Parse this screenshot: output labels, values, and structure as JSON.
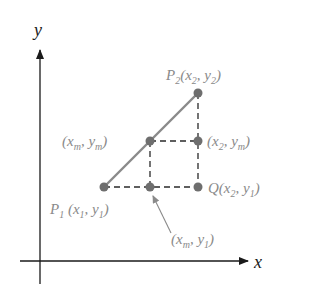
{
  "diagram": {
    "axes": {
      "x_label": "x",
      "y_label": "y"
    },
    "points": [
      {
        "id": "P1",
        "name": "P",
        "name_sub": "1",
        "coords": [
          {
            "v": "x",
            "s": "1"
          },
          {
            "v": "y",
            "s": "1"
          }
        ]
      },
      {
        "id": "P2",
        "name": "P",
        "name_sub": "2",
        "coords": [
          {
            "v": "x",
            "s": "2"
          },
          {
            "v": "y",
            "s": "2"
          }
        ]
      },
      {
        "id": "Q",
        "name": "Q",
        "name_sub": "",
        "coords": [
          {
            "v": "x",
            "s": "2"
          },
          {
            "v": "y",
            "s": "1"
          }
        ]
      },
      {
        "id": "M",
        "name": "",
        "name_sub": "",
        "coords": [
          {
            "v": "x",
            "s": "m"
          },
          {
            "v": "y",
            "s": "m"
          }
        ]
      },
      {
        "id": "R",
        "name": "",
        "name_sub": "",
        "coords": [
          {
            "v": "x",
            "s": "2"
          },
          {
            "v": "y",
            "s": "m"
          }
        ]
      },
      {
        "id": "S",
        "name": "",
        "name_sub": "",
        "coords": [
          {
            "v": "x",
            "s": "m"
          },
          {
            "v": "y",
            "s": "1"
          }
        ]
      }
    ],
    "labels": {
      "P2": {
        "name": "P",
        "sub": "2",
        "x": "x",
        "xs": "2",
        "y": "y",
        "ys": "2"
      },
      "M": {
        "x": "x",
        "xs": "m",
        "y": "y",
        "ys": "m"
      },
      "R": {
        "x": "x",
        "xs": "2",
        "y": "y",
        "ys": "m"
      },
      "Q": {
        "name": "Q",
        "x": "x",
        "xs": "2",
        "y": "y",
        "ys": "1"
      },
      "P1": {
        "name": "P",
        "sub": "1",
        "x": "x",
        "xs": "1",
        "y": "y",
        "ys": "1"
      },
      "S": {
        "x": "x",
        "xs": "m",
        "y": "y",
        "ys": "1"
      }
    },
    "colors": {
      "axis": "#1a1a1a",
      "segment": "#8a8a8a",
      "point": "#6e6e6e",
      "dashed": "#2a2a2a",
      "label": "#8a8a8a"
    }
  }
}
